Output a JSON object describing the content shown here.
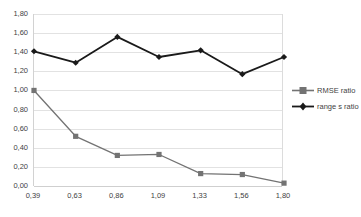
{
  "chart_data": {
    "type": "line",
    "title": "",
    "xlabel": "",
    "ylabel": "",
    "x": [
      0.39,
      0.63,
      0.86,
      1.09,
      1.33,
      1.56,
      1.8
    ],
    "categories": [
      "0,39",
      "0,63",
      "0,86",
      "1,09",
      "1,33",
      "1,56",
      "1,80"
    ],
    "series": [
      {
        "name": "RMSE ratio",
        "color": "#737373",
        "marker": "square",
        "values": [
          1.0,
          0.52,
          0.32,
          0.33,
          0.13,
          0.12,
          0.03
        ]
      },
      {
        "name": "range s ratio",
        "color": "#1a1a1a",
        "marker": "diamond",
        "values": [
          1.41,
          1.29,
          1.56,
          1.35,
          1.42,
          1.17,
          1.35
        ]
      }
    ],
    "ylim": [
      0.0,
      1.8
    ],
    "yticks": [
      1.8,
      1.6,
      1.4,
      1.2,
      1.0,
      0.8,
      0.6,
      0.4,
      0.2,
      0.0
    ],
    "ytick_labels": [
      "1,80",
      "1,60",
      "1,40",
      "1,20",
      "1,00",
      "0,80",
      "0,60",
      "0,40",
      "0,20",
      "0,00"
    ],
    "grid": true,
    "grid_color": "#e2e2e2",
    "legend_position": "right",
    "background": "#ffffff"
  },
  "legend": {
    "items": [
      {
        "label": "RMSE ratio"
      },
      {
        "label": "range s ratio"
      }
    ]
  }
}
